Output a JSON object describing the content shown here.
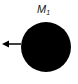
{
  "diagram": {
    "label": {
      "main": "M",
      "subscript": "1"
    },
    "body": {
      "shape": "circle",
      "color": "#000000"
    },
    "arrow": {
      "direction": "left",
      "color": "#000000"
    }
  }
}
